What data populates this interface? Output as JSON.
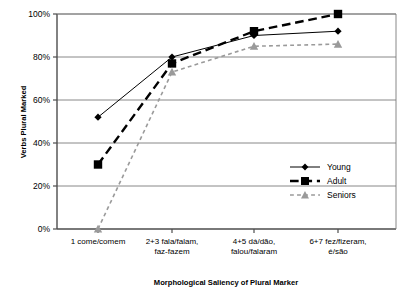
{
  "chart_data": {
    "type": "line",
    "title": "",
    "xlabel": "Morphological Saliency of Plural Marker",
    "ylabel": "Verbs Plural Marked",
    "categories": [
      "1 come/comem",
      "2+3 fala/falam, faz-fazem",
      "4+5 dá/dão, falou/falaram",
      "6+7 fez/fizeram, é/são"
    ],
    "category_lines": [
      [
        "1 come/comem"
      ],
      [
        "2+3 fala/falam,",
        "faz-fazem"
      ],
      [
        "4+5 dá/dão,",
        "falou/falaram"
      ],
      [
        "6+7 fez/fizeram,",
        "é/são"
      ]
    ],
    "ylim": [
      0,
      100
    ],
    "yticks": [
      0,
      20,
      40,
      60,
      80,
      100
    ],
    "ytick_labels": [
      "0%",
      "20%",
      "40%",
      "60%",
      "80%",
      "100%"
    ],
    "grid": true,
    "legend_position": "inside-right",
    "series": [
      {
        "name": "Young",
        "values": [
          52,
          80,
          90,
          92
        ],
        "color": "#000000",
        "marker": "diamond",
        "line_style": "solid",
        "line_width": 1
      },
      {
        "name": "Adult",
        "values": [
          30,
          77,
          92,
          100
        ],
        "color": "#000000",
        "marker": "square",
        "line_style": "dashed",
        "line_width": 2.4
      },
      {
        "name": "Seniors",
        "values": [
          0,
          73,
          85,
          86
        ],
        "color": "#9a9a9a",
        "marker": "triangle",
        "line_style": "dotted",
        "line_width": 1.6
      }
    ]
  },
  "legend": {
    "items": [
      {
        "label": "Young"
      },
      {
        "label": "Adult"
      },
      {
        "label": "Seniors"
      }
    ]
  },
  "colors": {
    "axis": "#4d4d4d",
    "grid": "#7a7a7a",
    "young": "#000000",
    "adult": "#000000",
    "seniors": "#9a9a9a",
    "background": "#ffffff"
  }
}
